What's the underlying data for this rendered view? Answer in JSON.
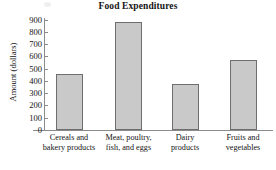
{
  "chart_data": {
    "type": "bar",
    "title": "Food Expenditures",
    "xlabel": "",
    "ylabel": "Amount (dollars)",
    "categories": [
      "Cereals and bakery products",
      "Meat, poultry, fish, and eggs",
      "Dairy products",
      "Fruits and vegetables"
    ],
    "category_lines": [
      [
        "Cereals and",
        "bakery products"
      ],
      [
        "Meat, poultry,",
        "fish, and eggs"
      ],
      [
        "Dairy",
        "products"
      ],
      [
        "Fruits and",
        "vegetables"
      ]
    ],
    "values": [
      460,
      880,
      375,
      570
    ],
    "ylim": [
      0,
      900
    ],
    "yticks": [
      0,
      100,
      200,
      300,
      400,
      500,
      600,
      700,
      800,
      900
    ],
    "ytick_labels": [
      "0",
      "100",
      "200",
      "300",
      "400",
      "500",
      "600",
      "700",
      "800",
      "900"
    ],
    "grid": false,
    "legend": false,
    "bar_fill_color": "#c9c9c9",
    "bar_edge_color": "#6e6e6e",
    "axis_color": "#8b8b8b",
    "text_color": "#141414"
  }
}
